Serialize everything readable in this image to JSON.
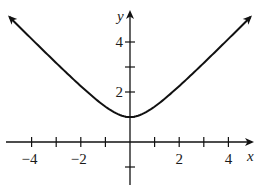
{
  "chart_data": {
    "type": "line",
    "title": "",
    "xlabel": "x",
    "ylabel": "y",
    "xlim": [
      -5,
      5
    ],
    "ylim": [
      -1,
      5.2
    ],
    "grid": false,
    "legend": null,
    "x_ticks": [
      -4,
      -3,
      -2,
      -1,
      1,
      2,
      3,
      4
    ],
    "x_tick_labels": [
      {
        "value": -4,
        "label": "−4"
      },
      {
        "value": -2,
        "label": "−2"
      },
      {
        "value": 2,
        "label": "2"
      },
      {
        "value": 4,
        "label": "4"
      }
    ],
    "y_ticks": [
      -1,
      1,
      2,
      3,
      4
    ],
    "y_tick_labels": [
      {
        "value": 2,
        "label": "2"
      },
      {
        "value": 4,
        "label": "4"
      }
    ],
    "series": [
      {
        "name": "y = sqrt(x^2 + 1)",
        "x": [
          -4.9,
          -4,
          -3,
          -2,
          -1,
          -0.5,
          0,
          0.5,
          1,
          2,
          3,
          4,
          4.9
        ],
        "values": [
          5.0,
          4.12,
          3.16,
          2.24,
          1.41,
          1.12,
          1.0,
          1.12,
          1.41,
          2.24,
          3.16,
          4.12,
          5.0
        ],
        "arrows_both_ends": true,
        "color": "#111111"
      }
    ],
    "annotations": []
  },
  "layout": {
    "origin_px": [
      130,
      142
    ],
    "unit_x_px": 24.6,
    "unit_y_px": 25
  }
}
